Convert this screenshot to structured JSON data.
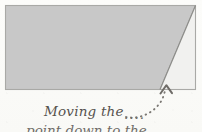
{
  "canvas": {
    "width": 202,
    "height": 132,
    "background_color": "#fbfbf9"
  },
  "figure": {
    "name": "parallelogram-fold-diagram",
    "shaded_region": {
      "label": "shaded-quadrilateral",
      "fill_color": "#c8c8c8",
      "stroke_color": "#9a9a98",
      "points": "5,5 196,5 160,90 5,90"
    },
    "light_region": {
      "label": "light-triangle",
      "fill_color": "#f1f1ef",
      "stroke_color": "#b4b4b1",
      "points": "196,5 196,90 160,90"
    },
    "outer_rect": {
      "label": "bounding-rectangle",
      "x": 5,
      "y": 5,
      "width": 191,
      "height": 85,
      "stroke_color": "#a7a7a4"
    },
    "diagonal_edge": {
      "label": "diagonal-fold-line",
      "x1": 196,
      "y1": 5,
      "x2": 160,
      "y2": 90,
      "stroke_color": "#8f8f8d"
    }
  },
  "annotation": {
    "arrow": {
      "name": "dotted-curved-arrow",
      "color": "#7d7a76",
      "path": "M 126,116 C 140,118 155,113 163,100",
      "head_tip_x": 166,
      "head_tip_y": 84,
      "dot_count": 14
    },
    "target_point": {
      "x": 166,
      "y": 88,
      "description": "vertex where diagonal meets bottom edge"
    }
  },
  "caption": {
    "line_1": "Moving the",
    "ellipsis": "....",
    "line_2": "point down to the",
    "text_color": "#56524e"
  }
}
